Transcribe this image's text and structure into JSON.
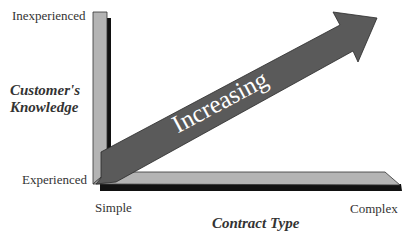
{
  "y_axis": {
    "title_line1": "Customer's",
    "title_line2": "Knowledge",
    "top_label": "Inexperienced",
    "bottom_label": "Experienced"
  },
  "x_axis": {
    "title": "Contract Type",
    "left_label": "Simple",
    "right_label": "Complex"
  },
  "arrow": {
    "label": "Increasing",
    "direction": "up-right"
  },
  "colors": {
    "bar_fill": "#b4b4b4",
    "bar_shadow": "#111111",
    "arrow_fill": "#5a5a5a",
    "text": "#333333"
  }
}
